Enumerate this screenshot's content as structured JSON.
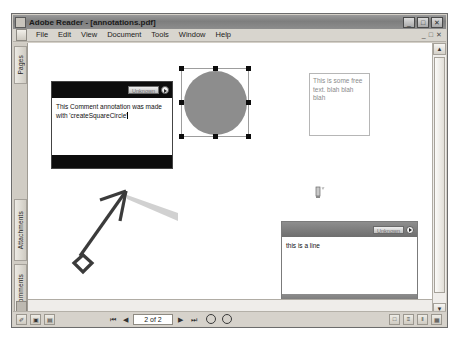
{
  "window": {
    "title": "Adobe Reader - [annotations.pdf]",
    "icon": "adobe-reader-icon",
    "controls": {
      "minimize": "_",
      "maximize": "□",
      "close": "✕"
    },
    "mdi_controls": {
      "minimize": "_",
      "restore": "□",
      "close": "✕"
    }
  },
  "menubar": {
    "doc_icon": "document-icon",
    "items": [
      {
        "label": "File"
      },
      {
        "label": "Edit"
      },
      {
        "label": "View"
      },
      {
        "label": "Document"
      },
      {
        "label": "Tools"
      },
      {
        "label": "Window"
      },
      {
        "label": "Help"
      }
    ]
  },
  "sidebar": {
    "tabs": [
      {
        "label": "Pages"
      },
      {
        "label": "Attachments"
      },
      {
        "label": "Comments"
      }
    ],
    "bottom_icon": "panel-icon"
  },
  "scrollbars": {
    "vertical": {
      "up_arrow": "▲",
      "down_arrow": "▼"
    },
    "horizontal": {
      "left_arrow": "◄",
      "right_arrow": "►"
    }
  },
  "document": {
    "annotations": {
      "comment_popup": {
        "author": "Unknown",
        "text": "This Comment annotation was made with 'createSquareCircle'",
        "menu_icon": "popup-menu-icon"
      },
      "square_circle": {
        "shape": "circle",
        "fill_color": "#8d8d8d",
        "selected": true,
        "handle_count": 8
      },
      "free_text": {
        "text": "This is some free text. blah blah blah"
      },
      "stamp": {
        "icon": "stamp-icon"
      },
      "line": {
        "start_style": "diamond",
        "end_style": "openarrow",
        "color": "#3b3b3b"
      },
      "line_popup": {
        "author": "Unknown",
        "text": "this is a line",
        "menu_icon": "popup-menu-icon"
      }
    }
  },
  "statusbar": {
    "tools": [
      {
        "icon": "select-tool-icon",
        "glyph": "✐"
      },
      {
        "icon": "snapshot-tool-icon",
        "glyph": "▣"
      },
      {
        "icon": "page-layout-icon",
        "glyph": "▤"
      }
    ],
    "nav": {
      "first": "⏮",
      "prev": "◀",
      "page_value": "2 of 2",
      "next": "▶",
      "last": "⏭"
    },
    "zoom": {
      "zoom_out": "zoom-out-icon",
      "zoom_in": "zoom-in-icon"
    },
    "right_buttons": [
      {
        "icon": "single-page-icon",
        "glyph": "□"
      },
      {
        "icon": "continuous-icon",
        "glyph": "≡"
      },
      {
        "icon": "facing-icon",
        "glyph": "‖"
      },
      {
        "icon": "continuous-facing-icon",
        "glyph": "▦"
      }
    ]
  }
}
